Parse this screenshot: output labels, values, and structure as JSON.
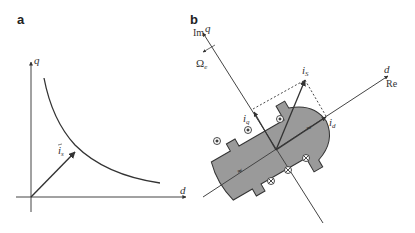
{
  "panels": {
    "a": {
      "label": "a",
      "q_axis_label": "q",
      "d_axis_label": "d",
      "vector_label": "i",
      "vector_sub": "s",
      "curve": "hyperbola (constant torque)"
    },
    "b": {
      "label": "b",
      "im_label": "Im",
      "q_axis_label": "q",
      "d_axis_label": "d",
      "re_label": "Re",
      "omega_label": "Ω",
      "omega_sub": "e",
      "is_label": "i",
      "is_sub": "S",
      "iq_label": "i",
      "iq_sub": "q",
      "id_label": "i",
      "id_sub": "d",
      "rotor_fill": "#9a9a9a",
      "dot_symbol": "⊙",
      "cross_symbol": "⊗"
    }
  },
  "colors": {
    "line": "#333333",
    "rotor": "#9a9a9a",
    "background": "#ffffff"
  }
}
